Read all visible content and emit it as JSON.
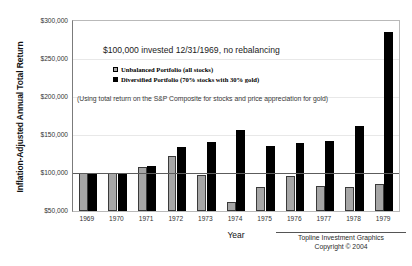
{
  "chart_data": {
    "type": "bar",
    "title": "$100,000 invested 12/31/1969, no rebalancing",
    "subtitle": "(Using total return on the S&P Composite for stocks and price appreciation for gold)",
    "xlabel": "Year",
    "ylabel": "Inflation-Adjusted Annual Total Return",
    "categories": [
      "1969",
      "1970",
      "1971",
      "1972",
      "1973",
      "1974",
      "1975",
      "1976",
      "1977",
      "1978",
      "1979"
    ],
    "series": [
      {
        "name": "Unbalanced Portfolio (all stocks)",
        "color": "#a6a6a6",
        "values": [
          100000,
          100000,
          108000,
          123000,
          98000,
          62000,
          81000,
          96000,
          83000,
          81000,
          85000
        ]
      },
      {
        "name": "Diversified Portfolio (70% stocks with 30% gold)",
        "color": "#000000",
        "values": [
          100000,
          100000,
          109000,
          134000,
          141000,
          156000,
          136000,
          139000,
          142000,
          162000,
          285000
        ]
      }
    ],
    "ylim": [
      50000,
      300000
    ],
    "yticks": [
      "$300,000",
      "$250,000",
      "$200,000",
      "$150,000",
      "$100,000",
      "$50,000"
    ],
    "ytick_values": [
      300000,
      250000,
      200000,
      150000,
      100000,
      50000
    ],
    "baseline_value": 100000,
    "grid": true,
    "legend_position": "inside-top-left"
  },
  "credit": {
    "line1": "Topline Investment Graphics",
    "line2": "Copyright © 2004"
  }
}
